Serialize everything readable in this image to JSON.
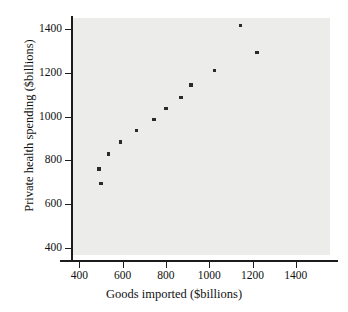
{
  "chart_data": {
    "type": "scatter",
    "title": "",
    "xlabel": "Goods imported ($billions)",
    "ylabel": "Private health spending ($billions)",
    "xlim": [
      310,
      1520
    ],
    "ylim": [
      370,
      1460
    ],
    "xticks": [
      400,
      600,
      800,
      1000,
      1200,
      1400
    ],
    "yticks": [
      400,
      600,
      800,
      1000,
      1200,
      1400
    ],
    "xtick_labels": [
      "400",
      "600",
      "800",
      "1000",
      "1200",
      "1400"
    ],
    "ytick_labels": [
      "400",
      "600",
      "800",
      "1000",
      "1200",
      "1400"
    ],
    "grid": false,
    "legend": "none",
    "marker": "square",
    "marker_color": "#2a2a2a",
    "panel_color": "#ececeb",
    "axis_color": "#1c1c1c",
    "points": [
      {
        "x": 500,
        "y": 695
      },
      {
        "x": 490,
        "y": 760
      },
      {
        "x": 535,
        "y": 830
      },
      {
        "x": 590,
        "y": 885
      },
      {
        "x": 665,
        "y": 938
      },
      {
        "x": 745,
        "y": 987
      },
      {
        "x": 800,
        "y": 1038
      },
      {
        "x": 870,
        "y": 1088
      },
      {
        "x": 915,
        "y": 1146
      },
      {
        "x": 1025,
        "y": 1212
      },
      {
        "x": 1145,
        "y": 1418
      },
      {
        "x": 1220,
        "y": 1295
      }
    ]
  }
}
